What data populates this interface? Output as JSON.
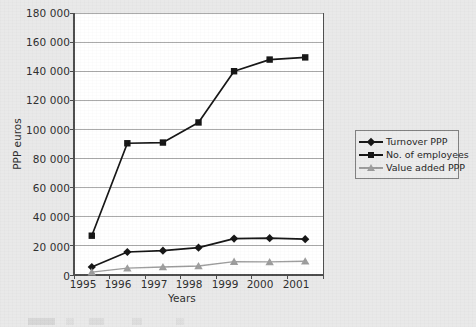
{
  "chart_data": {
    "type": "line",
    "title": "",
    "xlabel": "Years",
    "ylabel": "PPP euros",
    "categories": [
      "1995",
      "1996",
      "1997",
      "1998",
      "1999",
      "2000",
      "2001"
    ],
    "ylim": [
      0,
      180000
    ],
    "ytick_step": 20000,
    "ytick_labels": [
      "0",
      "20 000",
      "40 000",
      "60 000",
      "80 000",
      "100 000",
      "120 000",
      "140 000",
      "160 000",
      "180 000"
    ],
    "ytick_values": [
      0,
      20000,
      40000,
      60000,
      80000,
      100000,
      120000,
      140000,
      160000,
      180000
    ],
    "grid": "horizontal",
    "legend_position": "right",
    "series": [
      {
        "name": "Turnover PPP",
        "marker": "diamond",
        "color": "#111111",
        "values": [
          5500,
          15800,
          16700,
          18800,
          25000,
          25300,
          24600
        ]
      },
      {
        "name": "No. of employees",
        "marker": "square",
        "color": "#111111",
        "values": [
          27000,
          90500,
          91000,
          104800,
          140000,
          148000,
          149500
        ]
      },
      {
        "name": "Value added PPP",
        "marker": "triangle",
        "color": "#9b9b9b",
        "values": [
          2000,
          4700,
          5500,
          6200,
          9200,
          9000,
          9400
        ]
      }
    ]
  },
  "legend": {
    "entries": [
      {
        "label": "Turnover PPP",
        "marker": "diamond-marker-icon"
      },
      {
        "label": "No. of employees",
        "marker": "square-marker-icon"
      },
      {
        "label": "Value added PPP",
        "marker": "triangle-marker-icon"
      }
    ]
  },
  "colors": {
    "page_background": "#e9e9e9",
    "plot_background": "#ffffff",
    "axis": "#4a4a4a",
    "gridline": "#a8a8a8",
    "series_dark": "#111111",
    "series_gray": "#9b9b9b",
    "legend_border": "#7d7d7d"
  }
}
